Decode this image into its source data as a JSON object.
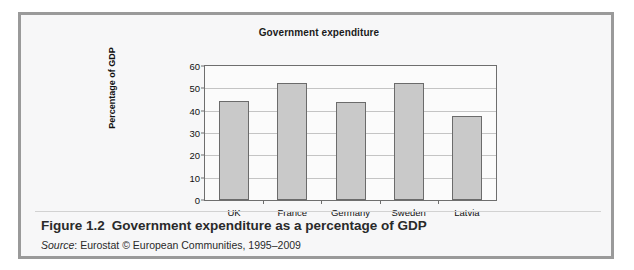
{
  "figure": {
    "number_label": "Figure 1.2",
    "caption": "Government expenditure as a percentage of GDP",
    "source_word": "Source",
    "source_separator": ": ",
    "source_text": "Eurostat © European Communities, 1995–2009"
  },
  "chart_data": {
    "type": "bar",
    "title": "Government expenditure",
    "xlabel": "",
    "ylabel": "Percentage of GDP",
    "categories": [
      "UK",
      "France",
      "Germany",
      "Sweden",
      "Latvia"
    ],
    "values": [
      44.5,
      52.3,
      43.8,
      52.3,
      37.8
    ],
    "ylim": [
      0,
      60
    ],
    "yticks": [
      0,
      10,
      20,
      30,
      40,
      50,
      60
    ],
    "ytick_labels": [
      "0",
      "10",
      "20",
      "30",
      "40",
      "50",
      "60"
    ],
    "grid": true,
    "legend": false,
    "bar_color": "#c9c9c9",
    "bar_border_color": "#6b6b6b",
    "axis_color": "#6e6e6e",
    "gridline_color": "#c4c4c4",
    "plot_background": "#fbfbfb"
  },
  "frame": {
    "border_color": "#9a9a9a",
    "background": "#f7f7f8"
  }
}
